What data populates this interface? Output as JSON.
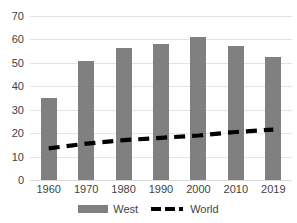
{
  "chart_data": {
    "type": "bar",
    "title": "",
    "xlabel": "",
    "ylabel": "",
    "ylim": [
      0,
      70
    ],
    "ytick_step": 10,
    "grid": true,
    "legend_position": "bottom",
    "categories": [
      "1960",
      "1970",
      "1980",
      "1990",
      "2000",
      "2010",
      "2019"
    ],
    "series": [
      {
        "name": "West",
        "type": "bar",
        "color": "#808080",
        "values": [
          35,
          51,
          56.5,
          58,
          61,
          57,
          52.5
        ]
      },
      {
        "name": "World",
        "type": "line",
        "style": "dashed",
        "color": "#000000",
        "values": [
          13.5,
          15.5,
          17,
          18,
          19,
          20.5,
          21.5
        ]
      }
    ],
    "yticks": [
      "0",
      "10",
      "20",
      "30",
      "40",
      "50",
      "60",
      "70"
    ]
  },
  "legend": {
    "items": [
      {
        "label": "West",
        "marker": "bar-swatch",
        "color": "#808080"
      },
      {
        "label": "World",
        "marker": "dashed-line-swatch",
        "color": "#000000"
      }
    ]
  },
  "colors": {
    "bar": "#808080",
    "line": "#000000",
    "grid": "#e4e4e4",
    "text": "#3f3f3f",
    "background": "#ffffff"
  }
}
